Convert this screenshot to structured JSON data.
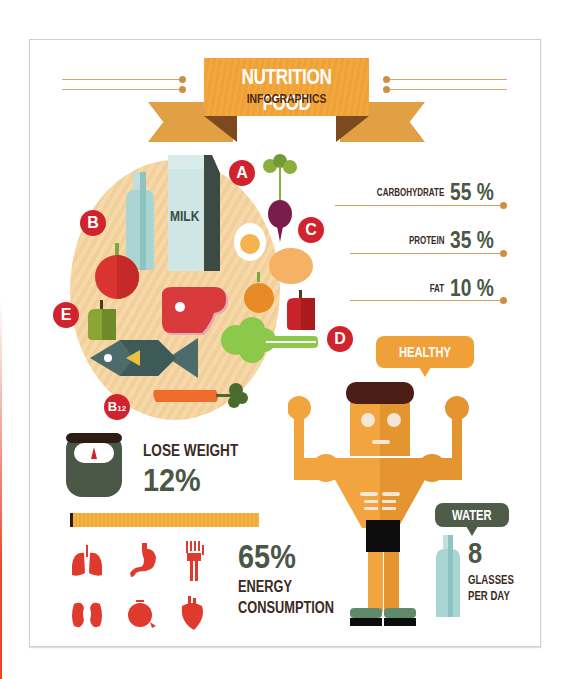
{
  "header": {
    "title": "NUTRITION FOOD",
    "subtitle": "INFOGRAPHICS"
  },
  "colors": {
    "accent_orange": "#f0a038",
    "badge_red": "#d0232e",
    "dark_green": "#4a5746",
    "brown_text": "#3b2a1e",
    "ribbon_fold": "#7c4a1f"
  },
  "plate": {
    "badges": [
      {
        "label": "A"
      },
      {
        "label": "B"
      },
      {
        "label": "C"
      },
      {
        "label": "D"
      },
      {
        "label": "E"
      },
      {
        "label": "B",
        "sub": "12"
      }
    ],
    "milk_label": "MILK",
    "foods": [
      "bottle",
      "milk-carton",
      "beet",
      "egg",
      "tomato",
      "potato",
      "meat-steak",
      "orange",
      "red-pepper",
      "green-pepper",
      "broccoli",
      "fish",
      "carrot"
    ]
  },
  "macros": [
    {
      "label": "CARBOHYDRATE",
      "value": "55 %"
    },
    {
      "label": "PROTEIN",
      "value": "35 %"
    },
    {
      "label": "FAT",
      "value": "10 %"
    }
  ],
  "healthy_body": {
    "label": "HEALTHY BODY"
  },
  "lose_weight": {
    "label": "LOSE WEIGHT",
    "value": "12%",
    "icon": "scale-icon"
  },
  "energy": {
    "value": "65%",
    "label_line1": "ENERGY",
    "label_line2": "CONSUMPTION",
    "organs": [
      "lungs-icon",
      "stomach-icon",
      "hand-bone-icon",
      "kidneys-icon",
      "eye-icon",
      "heart-icon"
    ]
  },
  "water": {
    "label": "WATER",
    "value": "8",
    "unit_line1": "GLASSES",
    "unit_line2": "PER DAY"
  }
}
